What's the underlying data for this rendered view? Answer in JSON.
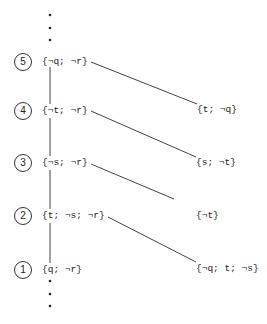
{
  "diagram": {
    "levels": [
      {
        "number": "5",
        "left": "{¬q; ¬r}",
        "right": "{t; ¬q}"
      },
      {
        "number": "4",
        "left": "{¬t; ¬r}",
        "right": "{s; ¬t}"
      },
      {
        "number": "3",
        "left": "{¬s; ¬r}",
        "right": "{¬t}"
      },
      {
        "number": "2",
        "left": "{t; ¬s; ¬r}",
        "right": "{¬q; t; ¬s}"
      },
      {
        "number": "1",
        "left": "{q; ¬r}",
        "right": ""
      }
    ],
    "ellipsis_top": "⋮",
    "ellipsis_bottom": "⋮"
  }
}
